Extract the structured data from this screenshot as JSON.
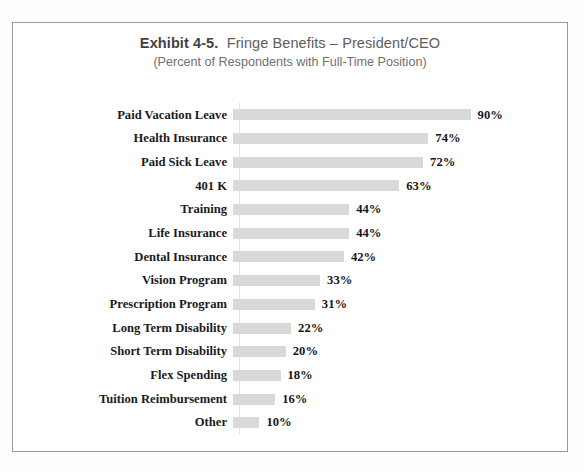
{
  "frame": {
    "border_color": "#9a9a9a",
    "background": "#ffffff"
  },
  "title": {
    "exhibit_prefix": "Exhibit 4-5.",
    "main": "Fringe Benefits – President/CEO",
    "subtitle": "(Percent of Respondents with Full-Time Position)"
  },
  "chart_data": {
    "type": "bar",
    "orientation": "horizontal",
    "subtitle": "(Percent of Respondents with Full-Time Position)",
    "xlabel": "",
    "ylabel": "",
    "xlim": [
      0,
      100
    ],
    "grid": false,
    "legend": "none",
    "bar_color": "#d9d9d9",
    "value_suffix": "%",
    "categories": [
      "Paid Vacation Leave",
      "Health Insurance",
      "Paid Sick Leave",
      "401 K",
      "Training",
      "Life Insurance",
      "Dental Insurance",
      "Vision Program",
      "Prescription Program",
      "Long Term Disability",
      "Short Term Disability",
      "Flex Spending",
      "Tuition Reimbursement",
      "Other"
    ],
    "values": [
      90,
      74,
      72,
      63,
      44,
      44,
      42,
      33,
      31,
      22,
      20,
      18,
      16,
      10
    ],
    "value_labels": [
      "90%",
      "74%",
      "72%",
      "63%",
      "44%",
      "44%",
      "42%",
      "33%",
      "31%",
      "22%",
      "20%",
      "18%",
      "16%",
      "10%"
    ]
  }
}
